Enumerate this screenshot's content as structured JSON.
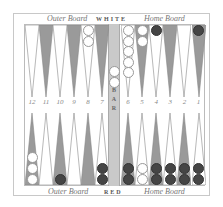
{
  "board": {
    "top_left_label": "Outer Board",
    "top_center_label": "WHITE",
    "top_right_label": "Home Board",
    "bottom_left_label": "Outer Board",
    "bottom_center_label": "RED",
    "bottom_right_label": "Home Board",
    "bar_label": "BAR",
    "point_numbers": [
      "12",
      "11",
      "10",
      "9",
      "8",
      "7",
      "6",
      "5",
      "4",
      "3",
      "2",
      "1"
    ],
    "colors": {
      "dark_point": "#9a9a9a",
      "light_point": "#ffffff",
      "white_checker": "#ffffff",
      "red_checker": "#454545",
      "bar": "#c9c9c9"
    }
  },
  "checkers": {
    "top": [
      {
        "col": 5,
        "color": "white",
        "count": 2
      },
      {
        "col": 7,
        "color": "white",
        "count": 5
      },
      {
        "col": 8,
        "color": "white",
        "count": 2
      },
      {
        "col": 9,
        "color": "red",
        "count": 1
      },
      {
        "col": 12,
        "color": "red",
        "count": 1
      }
    ],
    "bottom": [
      {
        "col": 1,
        "color": "white",
        "count": 3
      },
      {
        "col": 3,
        "color": "red",
        "count": 1
      },
      {
        "col": 6,
        "color": "red",
        "count": 2
      },
      {
        "col": 7,
        "color": "red",
        "count": 2
      },
      {
        "col": 8,
        "color": "white",
        "count": 2
      },
      {
        "col": 9,
        "color": "red",
        "count": 2
      },
      {
        "col": 10,
        "color": "red",
        "count": 2
      },
      {
        "col": 11,
        "color": "red",
        "count": 2
      },
      {
        "col": 12,
        "color": "red",
        "count": 2
      }
    ],
    "bar": {
      "color": "white",
      "count": 2
    }
  }
}
